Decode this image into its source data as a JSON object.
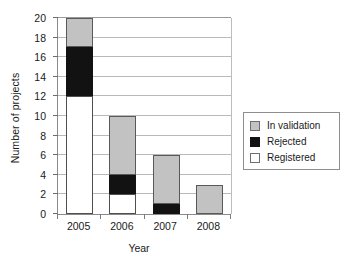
{
  "chart_data": {
    "type": "bar",
    "stacked": true,
    "title": "",
    "xlabel": "Year",
    "ylabel": "Number of projects",
    "categories": [
      "2005",
      "2006",
      "2007",
      "2008"
    ],
    "ylim": [
      0,
      20
    ],
    "yticks": [
      0,
      2,
      4,
      6,
      8,
      10,
      12,
      14,
      16,
      18,
      20
    ],
    "ytick_labels": [
      "0",
      "2",
      "4",
      "6",
      "8",
      "10",
      "12",
      "14",
      "16",
      "18",
      "20"
    ],
    "grid": true,
    "grid_axis": "y",
    "legend_position": "right",
    "series": [
      {
        "name": "Registered",
        "color": "#ffffff",
        "values": [
          12,
          2,
          0,
          0
        ]
      },
      {
        "name": "Rejected",
        "color": "#121212",
        "values": [
          5,
          2,
          1,
          0
        ]
      },
      {
        "name": "In validation",
        "color": "#c2c2c2",
        "values": [
          3,
          6,
          5,
          3
        ]
      }
    ],
    "totals": [
      20,
      10,
      6,
      3
    ],
    "segment_bounds": {
      "2005": {
        "registered": [
          0,
          12
        ],
        "rejected": [
          12,
          17
        ],
        "in_validation": [
          17,
          20
        ]
      },
      "2006": {
        "registered": [
          0,
          2
        ],
        "rejected": [
          2,
          4
        ],
        "in_validation": [
          4,
          10
        ]
      },
      "2007": {
        "registered": [
          0,
          0
        ],
        "rejected": [
          0,
          1
        ],
        "in_validation": [
          1,
          6
        ]
      },
      "2008": {
        "registered": [
          0,
          0
        ],
        "rejected": [
          0,
          0
        ],
        "in_validation": [
          0,
          3
        ]
      }
    }
  },
  "legend": {
    "items": [
      {
        "label": "In validation",
        "swatch": "validation"
      },
      {
        "label": "Rejected",
        "swatch": "rejected"
      },
      {
        "label": "Registered",
        "swatch": "registered"
      }
    ]
  }
}
